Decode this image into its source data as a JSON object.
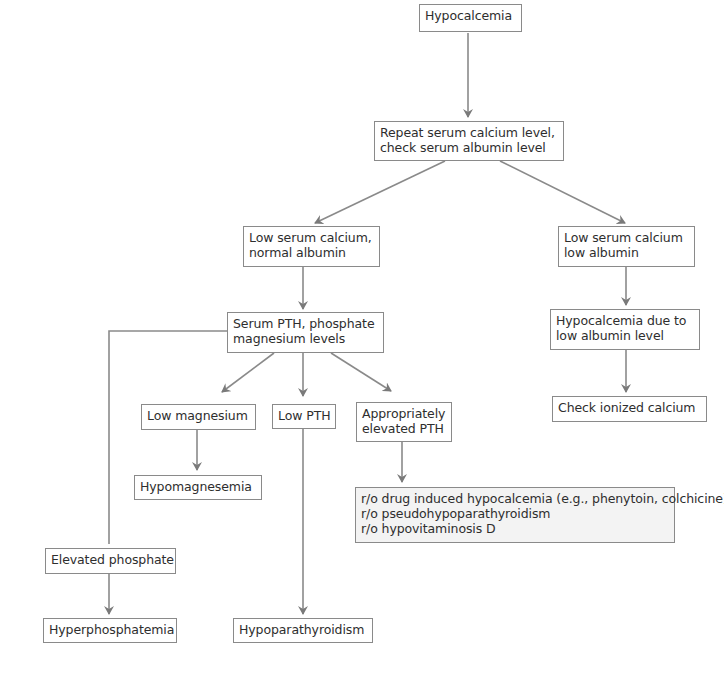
{
  "diagram": {
    "type": "flowchart",
    "title": "Hypocalcemia",
    "colors": {
      "line": "#8a8a8a",
      "text": "#2e2e2e",
      "box_fill": "#ffffff",
      "detail_fill": "#f3f3f3"
    },
    "nodes": {
      "root": {
        "lines": [
          "Hypocalcemia"
        ]
      },
      "repeat": {
        "lines": [
          "Repeat serum calcium level,",
          "check serum albumin level"
        ]
      },
      "normal_albumin": {
        "lines": [
          "Low serum calcium,",
          "normal albumin"
        ]
      },
      "low_albumin": {
        "lines": [
          "Low serum calcium",
          "low albumin"
        ]
      },
      "due_to_albumin": {
        "lines": [
          "Hypocalcemia due to",
          "low albumin level"
        ]
      },
      "ionized": {
        "lines": [
          "Check ionized calcium"
        ]
      },
      "serum_pth": {
        "lines": [
          "Serum PTH, phosphate",
          "magnesium levels"
        ]
      },
      "low_mg": {
        "lines": [
          "Low magnesium"
        ]
      },
      "low_pth": {
        "lines": [
          "Low PTH"
        ]
      },
      "elevated_pth": {
        "lines": [
          "Appropriately",
          "elevated PTH"
        ]
      },
      "hypomagnesemia": {
        "lines": [
          "Hypomagnesemia"
        ]
      },
      "ro_list": {
        "lines": [
          "r/o drug induced hypocalcemia (e.g., phenytoin, colchicine)",
          "r/o pseudohypoparathyroidism",
          "r/o hypovitaminosis D"
        ]
      },
      "elevated_phosphate": {
        "lines": [
          "Elevated phosphate"
        ]
      },
      "hyperphosphatemia": {
        "lines": [
          "Hyperphosphatemia"
        ]
      },
      "hypoparathyroidism": {
        "lines": [
          "Hypoparathyroidism"
        ]
      }
    },
    "edges": [
      [
        "root",
        "repeat"
      ],
      [
        "repeat",
        "normal_albumin"
      ],
      [
        "repeat",
        "low_albumin"
      ],
      [
        "low_albumin",
        "due_to_albumin"
      ],
      [
        "due_to_albumin",
        "ionized"
      ],
      [
        "normal_albumin",
        "serum_pth"
      ],
      [
        "serum_pth",
        "low_mg"
      ],
      [
        "serum_pth",
        "low_pth"
      ],
      [
        "serum_pth",
        "elevated_pth"
      ],
      [
        "serum_pth",
        "elevated_phosphate"
      ],
      [
        "low_mg",
        "hypomagnesemia"
      ],
      [
        "elevated_pth",
        "ro_list"
      ],
      [
        "elevated_phosphate",
        "hyperphosphatemia"
      ],
      [
        "low_pth",
        "hypoparathyroidism"
      ]
    ]
  }
}
